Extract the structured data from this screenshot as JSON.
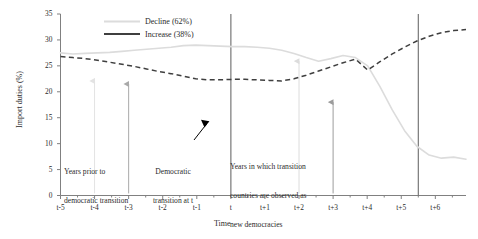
{
  "chart_data": {
    "type": "line",
    "title": "",
    "xlabel": "Time",
    "ylabel": "Import duties (%)",
    "x": [
      "t-5",
      "t-4",
      "t-3",
      "t-2",
      "t-1",
      "t",
      "t+1",
      "t+2",
      "t+3",
      "t+4",
      "t+5",
      "t+6"
    ],
    "xlim": [
      -5,
      6
    ],
    "ylim": [
      0,
      35
    ],
    "yticks": [
      0,
      5,
      10,
      15,
      20,
      25,
      30,
      35
    ],
    "ytick_labels": [
      "0",
      "5",
      "10",
      "15",
      "20",
      "25",
      "30",
      "35"
    ],
    "grid": false,
    "legend_position": "top-left",
    "series": [
      {
        "name": "Decline (62%)",
        "label": "Decline (62%)",
        "color": "#dcdcdc",
        "style": "solid",
        "values": [
          27.5,
          27.4,
          27.7,
          28.1,
          28.5,
          29.0,
          28.7,
          28.6,
          27.8,
          26.2,
          26.9,
          7.2
        ],
        "dense_values": [
          27.5,
          27.3,
          27.4,
          27.5,
          27.6,
          27.8,
          28.0,
          28.2,
          28.4,
          28.6,
          28.9,
          29.0,
          28.9,
          28.8,
          28.7,
          28.7,
          28.6,
          28.4,
          28.0,
          27.4,
          26.6,
          25.9,
          26.4,
          27.0,
          26.6,
          25.0,
          21.0,
          16.5,
          12.5,
          9.5,
          7.8,
          7.2,
          7.4,
          7.0
        ]
      },
      {
        "name": "Increase (38%)",
        "label": "Increase (38%)",
        "color": "#3f3f3f",
        "style": "dashed",
        "values": [
          26.8,
          26.3,
          25.6,
          24.5,
          23.3,
          22.4,
          22.3,
          22.3,
          22.1,
          23.6,
          25.6,
          31.9
        ],
        "dense_values": [
          26.8,
          26.6,
          26.4,
          26.1,
          25.7,
          25.3,
          24.9,
          24.4,
          23.9,
          23.5,
          23.0,
          22.5,
          22.3,
          22.3,
          22.4,
          22.4,
          22.3,
          22.2,
          22.1,
          22.5,
          23.2,
          24.0,
          24.8,
          25.6,
          26.3,
          24.2,
          25.8,
          27.3,
          28.6,
          29.8,
          30.7,
          31.4,
          31.8,
          32.0
        ]
      }
    ],
    "reference_lines": [
      {
        "name": "transition-line",
        "x": "t",
        "color": "#6b6b6b"
      },
      {
        "name": "observation-end-line",
        "x": "t+5.5",
        "color": "#6b6b6b"
      }
    ],
    "pointer_arrows": [
      {
        "name": "arrow-t-minus-4",
        "x": "t-4",
        "tip_y": 22.1,
        "base_y": 0.4,
        "color": "#e3e3e3"
      },
      {
        "name": "arrow-t-minus-3",
        "x": "t-3",
        "tip_y": 21.5,
        "base_y": 0.4,
        "color": "#a9a9a9"
      },
      {
        "name": "arrow-t-plus-2",
        "x": "t+2",
        "tip_y": 25.9,
        "base_y": 0.4,
        "color": "#dcdcdc"
      },
      {
        "name": "arrow-t-plus-3",
        "x": "t+3",
        "tip_y": 18.0,
        "base_y": 0.4,
        "color": "#9c9c9c"
      }
    ],
    "annotations": [
      {
        "name": "years-prior-note",
        "lines": [
          "Years prior to",
          "democratic transition"
        ]
      },
      {
        "name": "democratic-transition-note",
        "lines": [
          "Democratic",
          "transition at t"
        ]
      },
      {
        "name": "new-democracies-note",
        "lines": [
          "Years in which transition",
          "countries are observed as",
          "new democracies"
        ]
      }
    ]
  },
  "legend": {
    "entries": [
      {
        "label": "Decline (62%)"
      },
      {
        "label": "Increase (38%)"
      }
    ]
  },
  "axes": {
    "y_title": "Import duties (%)",
    "x_title": "Time",
    "y_ticks": [
      "35",
      "30",
      "25",
      "20",
      "15",
      "10",
      "5",
      "0"
    ],
    "x_ticks": [
      "t-5",
      "t-4",
      "t-3",
      "t-2",
      "t-1",
      "t",
      "t+1",
      "t+2",
      "t+3",
      "t+4",
      "t+5",
      "t+6"
    ]
  },
  "annotations": {
    "years_prior_line1": "Years prior to",
    "years_prior_line2": "democratic transition",
    "transition_line1": "Democratic",
    "transition_line2": "transition at t",
    "new_democracies_line1": "Years in which transition",
    "new_democracies_line2": "countries are observed as",
    "new_democracies_line3": "new democracies"
  },
  "colors": {
    "decline": "#dcdcdc",
    "increase": "#3f3f3f",
    "axis": "#808080",
    "reference_line": "#6b6b6b",
    "text": "#2b2b2b",
    "background": "#ffffff"
  }
}
